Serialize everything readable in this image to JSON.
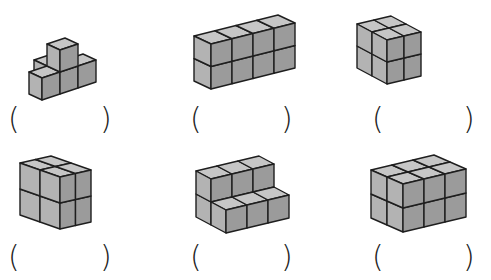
{
  "header": {
    "fragment": "· ' · ' ·  · · · ·  · ·"
  },
  "colors": {
    "top": "#c6c6c6",
    "left": "#b3b3b3",
    "right": "#9b9b9b",
    "stroke": "#1e1e1e"
  },
  "figures": [
    {
      "id": "fig-1",
      "label_open": "(",
      "label_close": ")",
      "origin": [
        60,
        94
      ],
      "axes": {
        "w": [
          18,
          -6
        ],
        "d": [
          -13,
          -6
        ],
        "h": [
          0,
          -22
        ]
      },
      "cubes": [
        [
          0,
          0,
          0
        ],
        [
          1,
          0,
          0
        ],
        [
          -1,
          0,
          0
        ],
        [
          0,
          0,
          1
        ],
        [
          0,
          1,
          0
        ]
      ],
      "paren_y": 104,
      "paren_x": [
        8,
        100
      ]
    },
    {
      "id": "fig-2",
      "label_open": "(",
      "label_close": ")",
      "origin": [
        211,
        89
      ],
      "axes": {
        "w": [
          21,
          -5.25
        ],
        "d": [
          -17,
          -8
        ],
        "h": [
          0,
          -22.5
        ]
      },
      "cubes": [
        [
          0,
          0,
          0
        ],
        [
          1,
          0,
          0
        ],
        [
          2,
          0,
          0
        ],
        [
          3,
          0,
          0
        ],
        [
          0,
          0,
          1
        ],
        [
          1,
          0,
          1
        ],
        [
          2,
          0,
          1
        ],
        [
          3,
          0,
          1
        ]
      ],
      "paren_y": 104,
      "paren_x": [
        190,
        281
      ]
    },
    {
      "id": "fig-3",
      "label_open": "(",
      "label_close": ")",
      "origin": [
        387,
        84
      ],
      "axes": {
        "w": [
          17,
          -4
        ],
        "d": [
          -15,
          -8
        ],
        "h": [
          0,
          -22
        ]
      },
      "cubes": [
        [
          0,
          1,
          0
        ],
        [
          0,
          1,
          1
        ],
        [
          0,
          0,
          0
        ],
        [
          0,
          0,
          1
        ],
        [
          1,
          1,
          0
        ],
        [
          1,
          1,
          1
        ],
        [
          1,
          0,
          0
        ],
        [
          1,
          0,
          1
        ]
      ],
      "cubes_note": "L-shape: right column one row forward",
      "paren_y": 104,
      "paren_x": [
        372,
        463
      ]
    },
    {
      "id": "fig-4",
      "label_open": "(",
      "label_close": ")",
      "origin": [
        60,
        229
      ],
      "axes": {
        "w": [
          15.5,
          -3.5
        ],
        "d": [
          -20,
          -7
        ],
        "h": [
          0,
          -26
        ]
      },
      "cubes": [
        [
          0,
          0,
          0
        ],
        [
          1,
          0,
          0
        ],
        [
          0,
          1,
          0
        ],
        [
          1,
          1,
          0
        ],
        [
          0,
          0,
          1
        ],
        [
          1,
          0,
          1
        ],
        [
          0,
          1,
          1
        ],
        [
          1,
          1,
          1
        ]
      ],
      "paren_y": 242,
      "paren_x": [
        8,
        100
      ]
    },
    {
      "id": "fig-5",
      "label_open": "(",
      "label_close": ")",
      "origin": [
        226,
        233
      ],
      "axes": {
        "w": [
          21,
          -5
        ],
        "d": [
          -15,
          -8
        ],
        "h": [
          0,
          -23
        ]
      },
      "cubes": [
        [
          0,
          0,
          0
        ],
        [
          1,
          0,
          0
        ],
        [
          2,
          0,
          0
        ],
        [
          0,
          1,
          0
        ],
        [
          1,
          1,
          0
        ],
        [
          2,
          1,
          0
        ],
        [
          0,
          1,
          1
        ],
        [
          1,
          1,
          1
        ],
        [
          2,
          1,
          1
        ]
      ],
      "paren_y": 242,
      "paren_x": [
        190,
        281
      ]
    },
    {
      "id": "fig-6",
      "label_open": "(",
      "label_close": ")",
      "origin": [
        403,
        232
      ],
      "axes": {
        "w": [
          21,
          -5
        ],
        "d": [
          -16,
          -7
        ],
        "h": [
          0,
          -24
        ]
      },
      "cubes": [
        [
          0,
          0,
          0
        ],
        [
          1,
          0,
          0
        ],
        [
          2,
          0,
          0
        ],
        [
          0,
          1,
          0
        ],
        [
          1,
          1,
          0
        ],
        [
          2,
          1,
          0
        ],
        [
          0,
          0,
          1
        ],
        [
          1,
          0,
          1
        ],
        [
          2,
          0,
          1
        ],
        [
          0,
          1,
          1
        ],
        [
          1,
          1,
          1
        ],
        [
          2,
          1,
          1
        ]
      ],
      "paren_y": 242,
      "paren_x": [
        372,
        463
      ]
    }
  ]
}
